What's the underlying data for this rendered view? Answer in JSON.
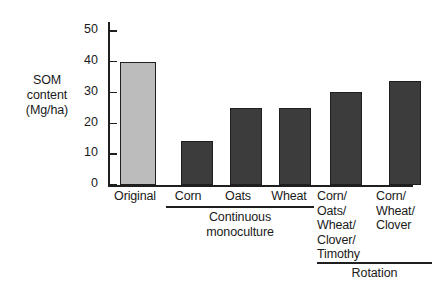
{
  "chart_data": {
    "type": "bar",
    "title": "",
    "subtitle": "",
    "xlabel": "",
    "ylabel": "SOM content (Mg/ha)",
    "ylabel_lines": [
      "SOM",
      "content",
      "(Mg/ha)"
    ],
    "categories": [
      "Original",
      "Corn",
      "Oats",
      "Wheat",
      "Corn/ Oats/ Wheat/ Clover/ Timothy",
      "Corn/ Wheat/ Clover"
    ],
    "category_lines": [
      [
        "Original"
      ],
      [
        "Corn"
      ],
      [
        "Oats"
      ],
      [
        "Wheat"
      ],
      [
        "Corn/",
        "Oats/",
        "Wheat/",
        "Clover/",
        "Timothy"
      ],
      [
        "Corn/",
        "Wheat/",
        "Clover"
      ]
    ],
    "values": [
      40,
      14.3,
      25,
      25,
      30.4,
      33.7
    ],
    "bar_colors": [
      "#bcbcbc",
      "#3d3c3c",
      "#3d3c3c",
      "#3d3c3c",
      "#3d3c3c",
      "#3d3c3c"
    ],
    "ylim": [
      0,
      53
    ],
    "yticks": [
      0,
      10,
      20,
      30,
      40,
      50
    ],
    "ytick_labels": [
      "0",
      "10",
      "20",
      "30",
      "40",
      "50"
    ],
    "grid": false,
    "legend": "none",
    "groups": [
      {
        "label_lines": [
          "Continuous",
          "monoculture"
        ],
        "members": [
          "Corn",
          "Oats",
          "Wheat"
        ]
      },
      {
        "label_lines": [
          "Rotation"
        ],
        "members": [
          "Corn/ Oats/ Wheat/ Clover/ Timothy",
          "Corn/ Wheat/ Clover"
        ]
      }
    ]
  },
  "axis": {
    "ytick_0": "0",
    "ytick_1": "10",
    "ytick_2": "20",
    "ytick_3": "30",
    "ytick_4": "40",
    "ytick_5": "50"
  },
  "ylabel": {
    "line1": "SOM",
    "line2": "content",
    "line3": "(Mg/ha)"
  },
  "categories": {
    "c0_l1": "Original",
    "c1_l1": "Corn",
    "c2_l1": "Oats",
    "c3_l1": "Wheat",
    "c4_l1": "Corn/",
    "c4_l2": "Oats/",
    "c4_l3": "Wheat/",
    "c4_l4": "Clover/",
    "c4_l5": "Timothy",
    "c5_l1": "Corn/",
    "c5_l2": "Wheat/",
    "c5_l3": "Clover"
  },
  "groups": {
    "g0_l1": "Continuous",
    "g0_l2": "monoculture",
    "g1_l1": "Rotation"
  },
  "colors": {
    "bar_light": "#bcbcbc",
    "bar_dark": "#3d3c3c",
    "axis": "#1f1f1f",
    "background": "#ffffff"
  }
}
